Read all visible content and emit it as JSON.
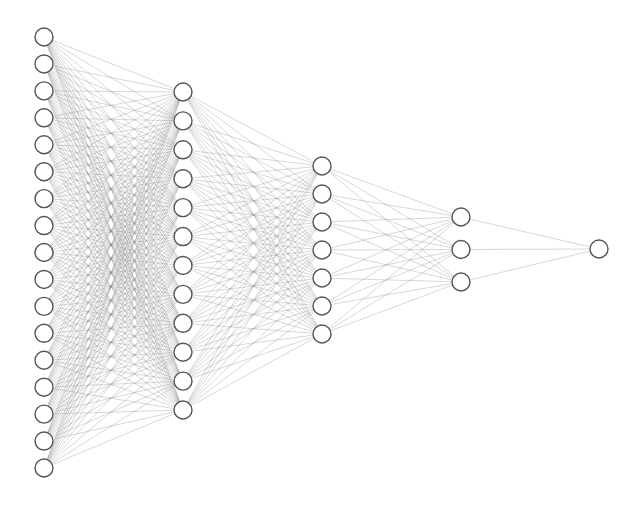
{
  "diagram": {
    "type": "fully-connected neural network",
    "colors": {
      "background": "#ffffff",
      "node_fill": "#ffffff",
      "node_stroke": "#555555",
      "edge": "#8a8a8a"
    },
    "node_radius": 9,
    "layers": [
      {
        "name": "input-layer",
        "nodes": 17,
        "x": 44,
        "y_start": 37,
        "y_end": 468
      },
      {
        "name": "hidden-layer-1",
        "nodes": 12,
        "x": 183,
        "y_start": 92,
        "y_end": 410
      },
      {
        "name": "hidden-layer-2",
        "nodes": 7,
        "x": 322,
        "y_start": 166,
        "y_end": 334
      },
      {
        "name": "hidden-layer-3",
        "nodes": 3,
        "x": 461,
        "y_start": 217,
        "y_end": 282
      },
      {
        "name": "output-layer",
        "nodes": 1,
        "x": 599,
        "y_start": 249,
        "y_end": 249
      }
    ]
  }
}
